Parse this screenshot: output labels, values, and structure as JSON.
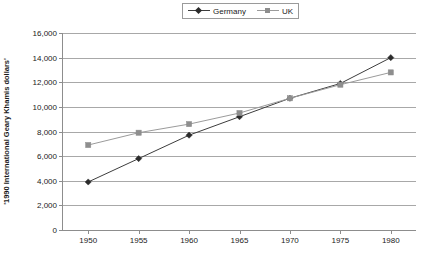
{
  "chart_data": {
    "type": "line",
    "title": "",
    "xlabel": "",
    "ylabel": "'1990 International Geary Khamis dollars'",
    "x": [
      1950,
      1955,
      1960,
      1965,
      1970,
      1975,
      1980
    ],
    "xtick_labels": [
      "1950",
      "1955",
      "1960",
      "1965",
      "1970",
      "1975",
      "1980"
    ],
    "ytick_labels": [
      "0",
      "2,000",
      "4,000",
      "6,000",
      "8,000",
      "10,000",
      "12,000",
      "14,000",
      "16,000"
    ],
    "yticks": [
      0,
      2000,
      4000,
      6000,
      8000,
      10000,
      12000,
      14000,
      16000
    ],
    "ylim": [
      0,
      16000
    ],
    "xlim": [
      1947.5,
      1982.5
    ],
    "grid": "horizontal",
    "legend_position": "top-center",
    "series": [
      {
        "name": "Germany",
        "color": "#3d3d3d",
        "marker": "diamond",
        "marker_color": "#2b2b2b",
        "values": [
          3900,
          5800,
          7700,
          9200,
          10700,
          11900,
          14000
        ]
      },
      {
        "name": "UK",
        "color": "#9b9b9b",
        "marker": "square",
        "marker_color": "#8e8e8e",
        "values": [
          6900,
          7900,
          8600,
          9500,
          10700,
          11800,
          12800
        ]
      }
    ]
  },
  "legend": {
    "entries": [
      {
        "label": "Germany"
      },
      {
        "label": "UK"
      }
    ]
  },
  "colors": {
    "germany": "#3d3d3d",
    "uk": "#9b9b9b",
    "axis": "#8d8d8d",
    "gridline": "#a8a8a8",
    "background": "#ffffff"
  }
}
